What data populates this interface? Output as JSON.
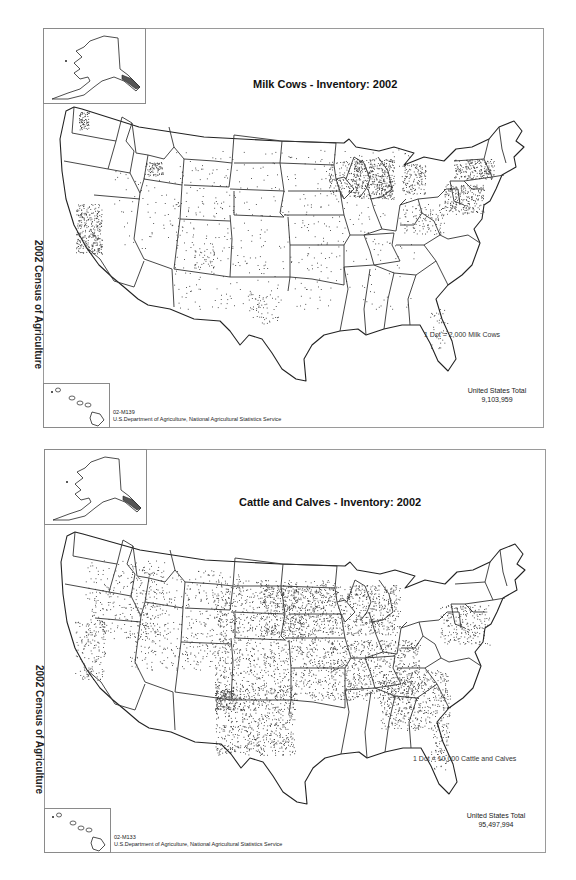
{
  "document": {
    "side_label": "2002 Census of Agriculture"
  },
  "maps": [
    {
      "id": "milk-cows",
      "title": "Milk Cows - Inventory:  2002",
      "legend": "1 Dot = 2,000 Milk Cows",
      "total_label": "United States Total",
      "total_value": "9,103,959",
      "map_code": "02-M139",
      "source": "U.S.Department of Agriculture, National Agricultural Statistics Service",
      "dot_color": "#333333",
      "density_hotspots": [
        "Wisconsin",
        "Minnesota",
        "California Central Valley",
        "Pennsylvania",
        "New York",
        "Michigan",
        "Idaho",
        "Washington",
        "Vermont"
      ]
    },
    {
      "id": "cattle-calves",
      "title": "Cattle and Calves - Inventory:  2002",
      "legend": "1 Dot = 10,000 Cattle and Calves",
      "total_label": "United States Total",
      "total_value": "95,497,994",
      "map_code": "02-M133",
      "source": "U.S.Department of Agriculture, National Agricultural Statistics Service",
      "dot_color": "#333333",
      "density_hotspots": [
        "Nebraska",
        "Kansas",
        "Texas",
        "Oklahoma",
        "Missouri",
        "Iowa",
        "South Dakota",
        "Kentucky",
        "Wisconsin"
      ]
    }
  ],
  "insets": {
    "alaska": "Alaska",
    "hawaii": "Hawaii"
  }
}
